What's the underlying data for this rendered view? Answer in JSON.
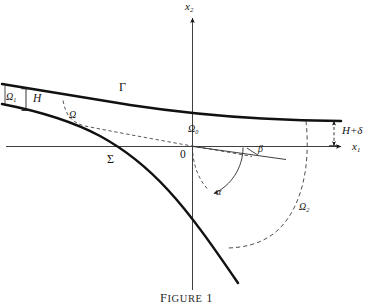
{
  "figure": {
    "caption_prefix": "F",
    "caption_rest": "IGURE",
    "caption_number": "1",
    "caption_full": "FIGURE 1"
  },
  "axes": {
    "vertical_label": "x",
    "vertical_sub": "2",
    "horizontal_label": "x",
    "horizontal_sub": "1",
    "origin_label": "0"
  },
  "curves": {
    "upper_label": "Γ",
    "lower_label": "Σ"
  },
  "regions": {
    "inlet": "Ω",
    "inlet_sub": "1",
    "middle": "Ω",
    "origin_region": "Ω",
    "origin_region_sub": "0",
    "outlet": "Ω",
    "outlet_sub": "2"
  },
  "dimensions": {
    "height_left": "H",
    "height_right": "H+δ"
  },
  "angles": {
    "alpha": "α",
    "beta": "β"
  },
  "colors": {
    "ink": "#141414",
    "thin_ink": "#4a4a4a",
    "background": "#ffffff"
  }
}
